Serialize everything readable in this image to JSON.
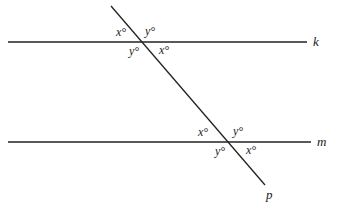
{
  "diagram": {
    "lines": [
      {
        "name": "k",
        "label": "k",
        "x1": 8,
        "y1": 42,
        "x2": 307,
        "y2": 42,
        "label_x": 313,
        "label_y": 46
      },
      {
        "name": "m",
        "label": "m",
        "x1": 8,
        "y1": 142,
        "x2": 311,
        "y2": 142,
        "label_x": 317,
        "label_y": 146
      },
      {
        "name": "p",
        "label": "p",
        "x1": 111,
        "y1": 6,
        "x2": 265,
        "y2": 185,
        "label_x": 266,
        "label_y": 199
      }
    ],
    "angles": [
      {
        "text": "x°",
        "x": 116,
        "y": 36
      },
      {
        "text": "y°",
        "x": 145,
        "y": 35
      },
      {
        "text": "y°",
        "x": 129,
        "y": 55
      },
      {
        "text": "x°",
        "x": 159,
        "y": 54
      },
      {
        "text": "x°",
        "x": 198,
        "y": 136
      },
      {
        "text": "y°",
        "x": 233,
        "y": 135
      },
      {
        "text": "y°",
        "x": 215,
        "y": 155
      },
      {
        "text": "x°",
        "x": 246,
        "y": 154
      }
    ],
    "stroke_color": "#222222"
  }
}
